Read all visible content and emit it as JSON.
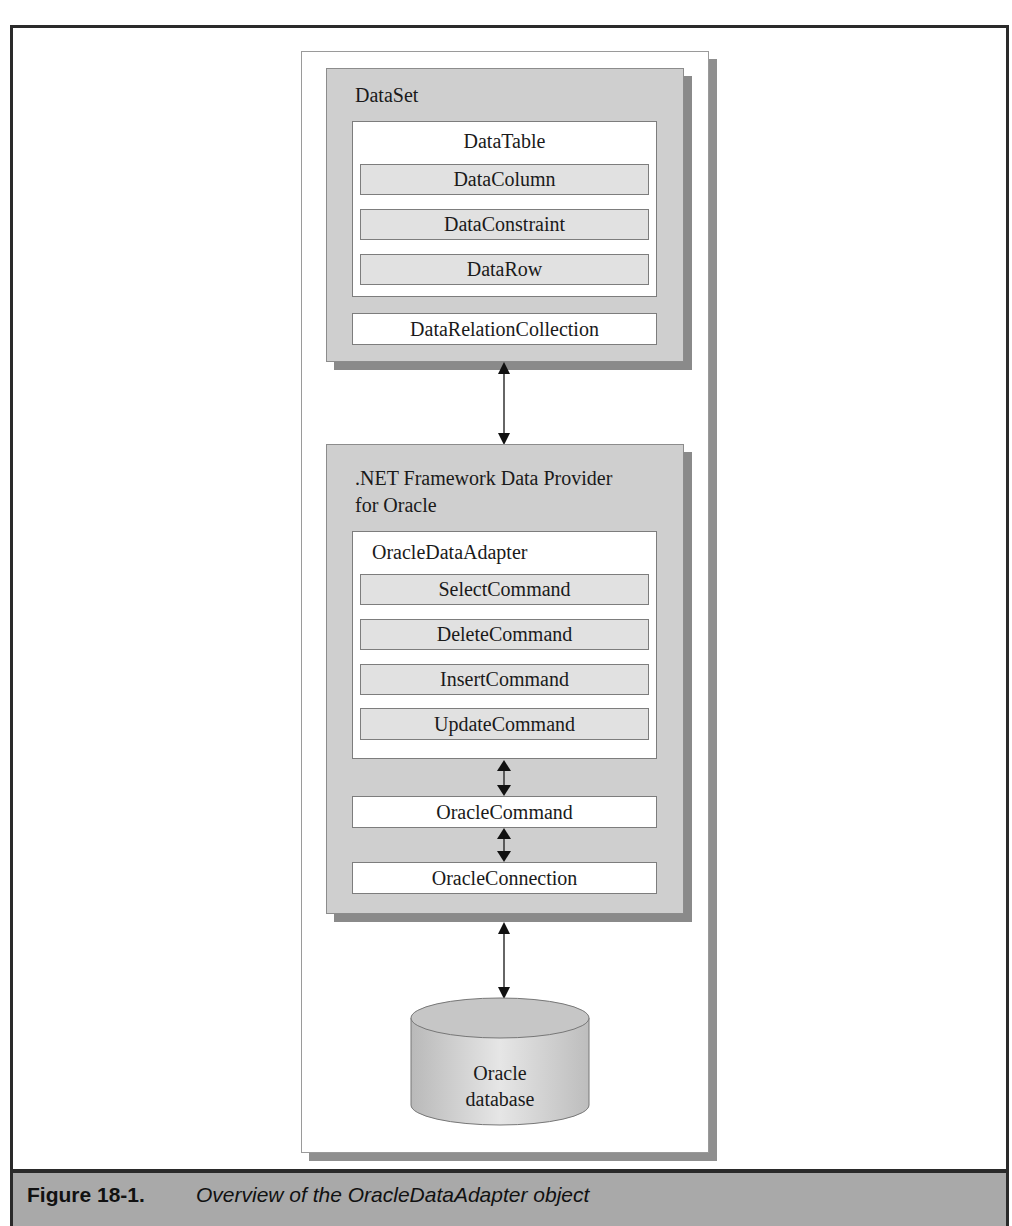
{
  "figure": {
    "number": "Figure 18-1.",
    "caption": "Overview of the OracleDataAdapter object"
  },
  "diagram": {
    "dataset": {
      "title": "DataSet",
      "datatable": {
        "title": "DataTable",
        "items": [
          "DataColumn",
          "DataConstraint",
          "DataRow"
        ]
      },
      "relation": "DataRelationCollection"
    },
    "provider": {
      "title_line1": ".NET Framework Data Provider",
      "title_line2": "for Oracle",
      "adapter": {
        "title": "OracleDataAdapter",
        "commands": [
          "SelectCommand",
          "DeleteCommand",
          "InsertCommand",
          "UpdateCommand"
        ]
      },
      "command": "OracleCommand",
      "connection": "OracleConnection"
    },
    "database": {
      "line1": "Oracle",
      "line2": "database"
    },
    "connectors": [
      {
        "from": "DataSet",
        "to": ".NET Framework Data Provider for Oracle",
        "type": "bidirectional"
      },
      {
        "from": "OracleDataAdapter",
        "to": "OracleCommand",
        "type": "bidirectional"
      },
      {
        "from": "OracleCommand",
        "to": "OracleConnection",
        "type": "bidirectional"
      },
      {
        "from": ".NET Framework Data Provider for Oracle",
        "to": "Oracle database",
        "type": "bidirectional"
      }
    ],
    "colors": {
      "box_gray": "#cfcfcf",
      "item_gray": "#e1e1e1",
      "shadow": "#8a8a8a",
      "caption_bar": "#a9a9a9",
      "frame_border": "#2a2a2a"
    }
  }
}
